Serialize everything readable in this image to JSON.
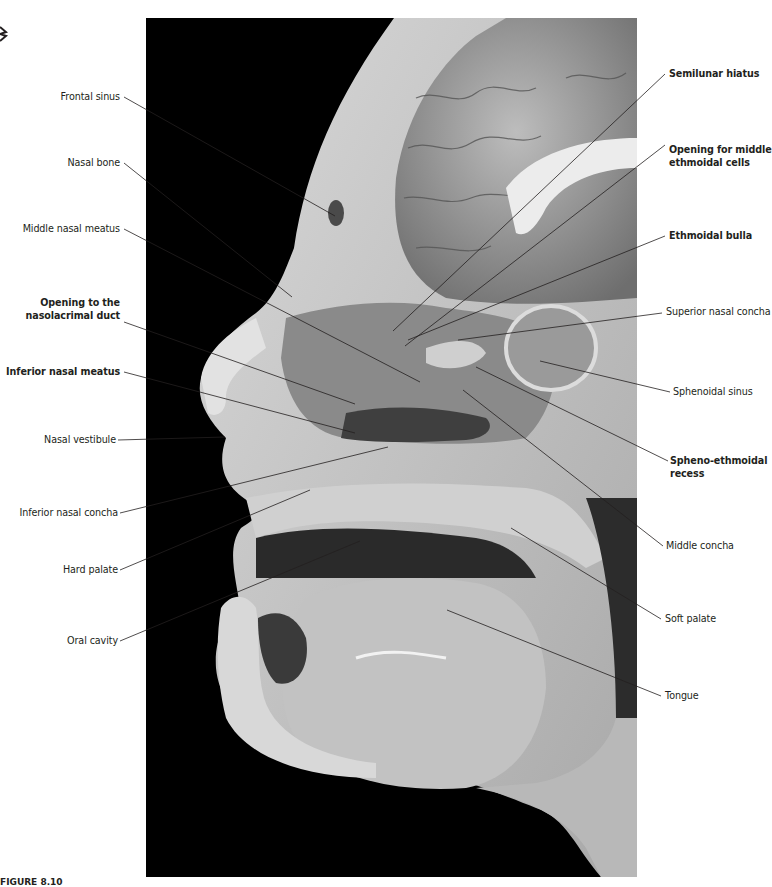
{
  "figure": {
    "caption_prefix": "FIGURE 8.10",
    "caption_text": "Nasal cavity, lateral wall. The conchae ... (caption cut off)",
    "photo_background": "#000000",
    "leader_color": "#231f20"
  },
  "labels_left": [
    {
      "id": "frontal-sinus",
      "text": "Frontal sinus",
      "bold": false
    },
    {
      "id": "nasal-bone",
      "text": "Nasal bone",
      "bold": false
    },
    {
      "id": "middle-nasal-meatus",
      "text": "Middle nasal meatus",
      "bold": false
    },
    {
      "id": "opening-nasolacrimal-duct",
      "line1": "Opening to the",
      "line2": "nasolacrimal duct",
      "bold": true
    },
    {
      "id": "inferior-nasal-meatus",
      "text": "Inferior nasal meatus",
      "bold": true
    },
    {
      "id": "nasal-vestibule",
      "text": "Nasal vestibule",
      "bold": false
    },
    {
      "id": "inferior-nasal-concha",
      "text": "Inferior nasal concha",
      "bold": false
    },
    {
      "id": "hard-palate",
      "text": "Hard palate",
      "bold": false
    },
    {
      "id": "oral-cavity",
      "text": "Oral cavity",
      "bold": false
    }
  ],
  "labels_right": [
    {
      "id": "semilunar-hiatus",
      "text": "Semilunar hiatus",
      "bold": true
    },
    {
      "id": "opening-middle-ethmoidal",
      "line1": "Opening for middle",
      "line2": "ethmoidal cells",
      "bold": true
    },
    {
      "id": "ethmoidal-bulla",
      "text": "Ethmoidal bulla",
      "bold": true
    },
    {
      "id": "superior-nasal-concha",
      "text": "Superior nasal concha",
      "bold": false
    },
    {
      "id": "sphenoidal-sinus",
      "text": "Sphenoidal sinus",
      "bold": false
    },
    {
      "id": "spheno-ethmoidal-recess",
      "line1": "Spheno-ethmoidal",
      "line2": "recess",
      "bold": true
    },
    {
      "id": "middle-concha",
      "text": "Middle concha",
      "bold": false
    },
    {
      "id": "soft-palate",
      "text": "Soft palate",
      "bold": false
    },
    {
      "id": "tongue",
      "text": "Tongue",
      "bold": false
    }
  ]
}
